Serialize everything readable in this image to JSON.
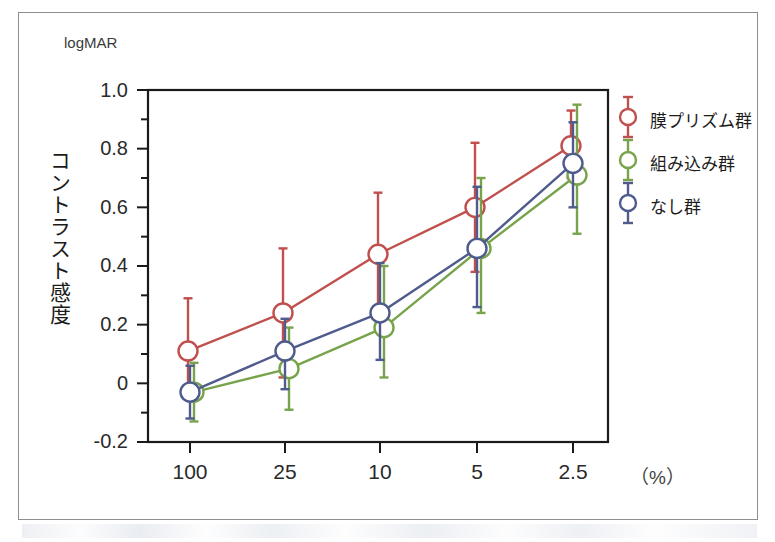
{
  "chart_data": {
    "type": "line",
    "title": "",
    "subtitle": "",
    "unit_label_y": "logMAR",
    "ylabel": "コントラスト感度",
    "xlabel": "",
    "x_unit_label": "（%）",
    "categories": [
      "100",
      "25",
      "10",
      "5",
      "2.5"
    ],
    "x_tick_labels": [
      "100",
      "25",
      "10",
      "5",
      "2.5"
    ],
    "y_tick_labels": [
      "1.0",
      "0.8",
      "0.6",
      "0.4",
      "0.2",
      "0",
      "-0.2"
    ],
    "y_tick_values": [
      1.0,
      0.8,
      0.6,
      0.4,
      0.2,
      0,
      -0.2
    ],
    "ylim": [
      -0.2,
      1.0
    ],
    "minor_ticks": true,
    "grid": false,
    "legend_position": "right",
    "error_bars": "symmetric-sd",
    "series": [
      {
        "name": "膜プリズム群",
        "color": "#c0504d",
        "marker": "open-circle",
        "values": [
          0.11,
          0.24,
          0.44,
          0.6,
          0.81
        ],
        "err_low": [
          -0.05,
          0.02,
          0.24,
          0.38,
          0.7
        ],
        "err_high": [
          0.29,
          0.46,
          0.65,
          0.82,
          0.93
        ]
      },
      {
        "name": "組み込み群",
        "color": "#77a34b",
        "marker": "open-circle",
        "values": [
          -0.03,
          0.05,
          0.19,
          0.46,
          0.71
        ],
        "err_low": [
          -0.13,
          -0.09,
          0.02,
          0.24,
          0.51
        ],
        "err_high": [
          0.07,
          0.19,
          0.4,
          0.7,
          0.95
        ]
      },
      {
        "name": "なし群",
        "color": "#4a5municipal",
        "marker": "open-circle",
        "values": [
          -0.03,
          0.11,
          0.24,
          0.46,
          0.75
        ],
        "err_low": [
          -0.12,
          -0.02,
          0.08,
          0.26,
          0.6
        ],
        "err_high": [
          0.06,
          0.22,
          0.41,
          0.67,
          0.89
        ]
      }
    ]
  },
  "legend": {
    "items": [
      {
        "label": "膜プリズム群",
        "color": "#c0504d"
      },
      {
        "label": "組み込み群",
        "color": "#77a34b"
      },
      {
        "label": "なし群",
        "color": "#4f5b8c"
      }
    ]
  },
  "colors": {
    "red": "#c0504d",
    "green": "#77a34b",
    "blue": "#4f5b8c",
    "axis": "#1a1a1a",
    "frame": "#8b8f93"
  }
}
